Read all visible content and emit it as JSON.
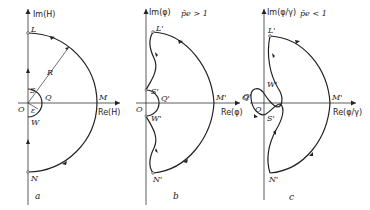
{
  "panels": [
    {
      "id": "a",
      "caption": "a",
      "axes": {
        "imag": "Im(H)",
        "real": "Re(H)"
      },
      "points": {
        "L": "L",
        "S": "S",
        "Q": "Q",
        "O": "O",
        "eps": "ε",
        "W": "W",
        "M": "M",
        "N": "N",
        "R": "R"
      },
      "description": "Nyquist contour in H-plane: large semicircle radius R through L, M, N; small indentation radius ε around origin through S, Q, W"
    },
    {
      "id": "b",
      "caption": "b",
      "condition": "p̄e > 1",
      "axes": {
        "imag": "Im(φ)",
        "real": "Re(φ)"
      },
      "points": {
        "L": "L'",
        "S": "S'",
        "Q": "Q'",
        "O": "O",
        "W": "W'",
        "M": "M'",
        "N": "N'",
        "Q_far": "Q"
      },
      "description": "Mapped contour, origin not encircled"
    },
    {
      "id": "c",
      "caption": "c",
      "condition": "p̄e < 1",
      "axes": {
        "imag": "Im(φ/γ)",
        "real": "Re(φ/γ)"
      },
      "points": {
        "L": "L'",
        "W": "W'",
        "Q": "Q'",
        "O": "O",
        "S": "S'",
        "M": "M'",
        "N": "N'"
      },
      "description": "Mapped contour with self-crossing, loop around origin"
    }
  ]
}
